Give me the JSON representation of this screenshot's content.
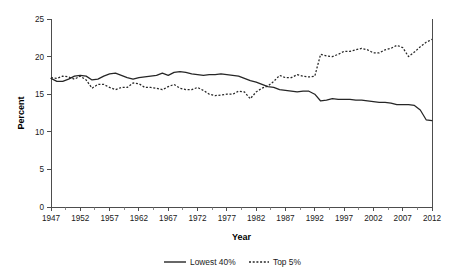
{
  "chart_data": {
    "type": "line",
    "title": "",
    "xlabel": "Year",
    "ylabel": "Percent",
    "xlim": [
      1947,
      2012
    ],
    "ylim": [
      0,
      25
    ],
    "grid": false,
    "legend_position": "bottom",
    "y_ticks": [
      "0",
      "5",
      "10",
      "15",
      "20",
      "25"
    ],
    "y_tick_values": [
      0,
      5,
      10,
      15,
      20,
      25
    ],
    "x_ticks": [
      "1947",
      "1952",
      "1957",
      "1962",
      "1967",
      "1972",
      "1977",
      "1982",
      "1987",
      "1992",
      "1997",
      "2002",
      "2007",
      "2012"
    ],
    "x_tick_values": [
      1947,
      1952,
      1957,
      1962,
      1967,
      1972,
      1977,
      1982,
      1987,
      1992,
      1997,
      2002,
      2007,
      2012
    ],
    "x_minor_step": 1,
    "x": [
      1947,
      1948,
      1949,
      1950,
      1951,
      1952,
      1953,
      1954,
      1955,
      1956,
      1957,
      1958,
      1959,
      1960,
      1961,
      1962,
      1963,
      1964,
      1965,
      1966,
      1967,
      1968,
      1969,
      1970,
      1971,
      1972,
      1973,
      1974,
      1975,
      1976,
      1977,
      1978,
      1979,
      1980,
      1981,
      1982,
      1983,
      1984,
      1985,
      1986,
      1987,
      1988,
      1989,
      1990,
      1991,
      1992,
      1993,
      1994,
      1995,
      1996,
      1997,
      1998,
      1999,
      2000,
      2001,
      2002,
      2003,
      2004,
      2005,
      2006,
      2007,
      2008,
      2009,
      2010,
      2011,
      2012
    ],
    "series": [
      {
        "name": "Lowest 40%",
        "style": "solid",
        "color": "#262626",
        "values": [
          17.1,
          16.7,
          16.7,
          17.0,
          17.4,
          17.5,
          17.4,
          16.9,
          17.0,
          17.4,
          17.7,
          17.8,
          17.5,
          17.2,
          17.0,
          17.2,
          17.3,
          17.4,
          17.5,
          17.8,
          17.5,
          17.9,
          18.0,
          17.9,
          17.7,
          17.6,
          17.5,
          17.6,
          17.6,
          17.7,
          17.6,
          17.5,
          17.4,
          17.1,
          16.8,
          16.6,
          16.3,
          16.0,
          15.9,
          15.6,
          15.5,
          15.4,
          15.3,
          15.4,
          15.4,
          15.0,
          14.1,
          14.2,
          14.4,
          14.3,
          14.3,
          14.3,
          14.2,
          14.2,
          14.1,
          14.0,
          13.9,
          13.9,
          13.8,
          13.6,
          13.6,
          13.6,
          13.5,
          12.9,
          11.6,
          11.5
        ]
      },
      {
        "name": "Top 5%",
        "style": "dotted",
        "color": "#262626",
        "values": [
          17.2,
          17.1,
          17.4,
          17.3,
          17.0,
          17.4,
          16.9,
          15.8,
          16.3,
          16.3,
          15.9,
          15.6,
          15.9,
          15.9,
          16.5,
          16.4,
          15.9,
          15.9,
          15.8,
          15.6,
          16.0,
          16.3,
          15.8,
          15.6,
          15.6,
          15.9,
          15.5,
          15.0,
          14.8,
          14.9,
          15.0,
          15.0,
          15.4,
          15.3,
          14.4,
          15.3,
          15.8,
          16.1,
          16.7,
          17.5,
          17.2,
          17.2,
          17.6,
          17.4,
          17.3,
          17.4,
          20.3,
          20.1,
          20.0,
          20.3,
          20.7,
          20.7,
          20.9,
          21.1,
          20.9,
          20.5,
          20.5,
          20.9,
          21.1,
          21.5,
          21.2,
          20.0,
          20.6,
          21.3,
          21.9,
          22.3
        ]
      }
    ],
    "legend": [
      {
        "label": "Lowest 40%",
        "style": "solid"
      },
      {
        "label": "Top 5%",
        "style": "dotted"
      }
    ]
  }
}
